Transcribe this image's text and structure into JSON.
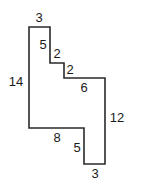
{
  "diagram": {
    "type": "rectilinear-polygon",
    "stroke_color": "#2a2a2a",
    "points": "29,27 50,27 50,63 64,63 64,78 105,78 105,164 84,164 84,128 29,128",
    "labels": [
      {
        "text": "3",
        "x": 39,
        "y": 22,
        "side": "top"
      },
      {
        "text": "5",
        "x": 43,
        "y": 49,
        "side": "step-vertical-1"
      },
      {
        "text": "2",
        "x": 57,
        "y": 58,
        "side": "step-horizontal-1"
      },
      {
        "text": "2",
        "x": 70,
        "y": 74,
        "side": "step-horizontal-2"
      },
      {
        "text": "6",
        "x": 84,
        "y": 92,
        "side": "upper-right-horizontal"
      },
      {
        "text": "14",
        "x": 16,
        "y": 86,
        "side": "left"
      },
      {
        "text": "12",
        "x": 117,
        "y": 122,
        "side": "right"
      },
      {
        "text": "8",
        "x": 57,
        "y": 142,
        "side": "bottom-left-horizontal"
      },
      {
        "text": "5",
        "x": 77,
        "y": 152,
        "side": "inner-vertical"
      },
      {
        "text": "3",
        "x": 95,
        "y": 178,
        "side": "bottom"
      }
    ]
  }
}
